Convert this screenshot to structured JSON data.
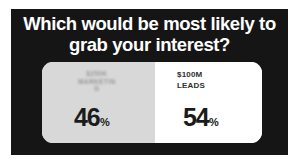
{
  "poll": {
    "headline_line1": "Which would be most likely to",
    "headline_line2": "grab your interest?",
    "background_color": "#151515",
    "headline_color": "#ffffff",
    "options": [
      {
        "label": "$250K\nMARKETIN\nG",
        "label_legible": false,
        "percent": "46",
        "percent_sign": "%",
        "fill_color": "#d8d8d8"
      },
      {
        "label": "$100M\nLEADS",
        "label_legible": true,
        "percent": "54",
        "percent_sign": "%",
        "fill_color": "#ffffff"
      }
    ]
  },
  "chart_data": {
    "type": "bar",
    "title": "Which would be most likely to grab your interest?",
    "categories": [
      "$250K MARKETING (blurred)",
      "$100M LEADS"
    ],
    "values": [
      46,
      54
    ],
    "xlabel": "",
    "ylabel": "Share of votes (%)",
    "ylim": [
      0,
      100
    ],
    "legend": false,
    "grid": false,
    "annotations": [
      "46%",
      "54%"
    ]
  }
}
